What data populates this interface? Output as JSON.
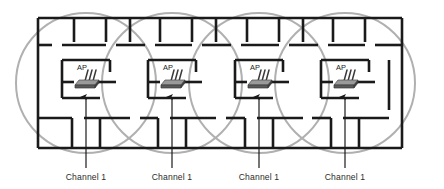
{
  "diagram": {
    "type": "floor-plan-coverage",
    "canvas": {
      "width": 444,
      "height": 189,
      "background": "#ffffff"
    },
    "colors": {
      "wall": "#1a1a1a",
      "coverage_circle": "#b0b0b0",
      "arrow": "#1a1a1a",
      "label_text": "#2b2b2b",
      "ap_label_text": "#1a1a1a",
      "ap_device_body": "#4a4a4a",
      "ap_device_top": "#8a8a8a"
    },
    "building": {
      "outline": {
        "x": 38,
        "y": 18,
        "width": 364,
        "height": 130
      },
      "wall_thickness": 2.6
    },
    "coverage": {
      "shape": "circle",
      "radius": 70,
      "stroke_width": 2.0,
      "stroke_color": "#b0b0b0",
      "fill": "none",
      "overlapping": true,
      "count": 4
    },
    "access_points": [
      {
        "id": "ap-1",
        "label": "AP",
        "channel_label": "Channel 1",
        "device_x": 86,
        "device_y": 83,
        "label_x": 82,
        "label_y": 70,
        "circle_cx": 86,
        "circle_cy": 83,
        "arrow_x": 86,
        "arrow_top_y": 97,
        "arrow_bottom_y": 168,
        "text_x": 86,
        "text_y": 180
      },
      {
        "id": "ap-2",
        "label": "AP",
        "channel_label": "Channel 1",
        "device_x": 172,
        "device_y": 83,
        "label_x": 168,
        "label_y": 70,
        "circle_cx": 172,
        "circle_cy": 83,
        "arrow_x": 172,
        "arrow_top_y": 97,
        "arrow_bottom_y": 168,
        "text_x": 172,
        "text_y": 180
      },
      {
        "id": "ap-3",
        "label": "AP",
        "channel_label": "Channel 1",
        "device_x": 259,
        "device_y": 83,
        "label_x": 255,
        "label_y": 70,
        "circle_cx": 259,
        "circle_cy": 83,
        "arrow_x": 259,
        "arrow_top_y": 97,
        "arrow_bottom_y": 168,
        "text_x": 259,
        "text_y": 180
      },
      {
        "id": "ap-4",
        "label": "AP",
        "channel_label": "Channel 1",
        "device_x": 345,
        "device_y": 83,
        "label_x": 341,
        "label_y": 70,
        "circle_cx": 345,
        "circle_cy": 83,
        "arrow_x": 345,
        "arrow_top_y": 97,
        "arrow_bottom_y": 168,
        "text_x": 345,
        "text_y": 180
      }
    ],
    "labels": {
      "ap_short": "AP",
      "channel": "Channel 1"
    }
  }
}
